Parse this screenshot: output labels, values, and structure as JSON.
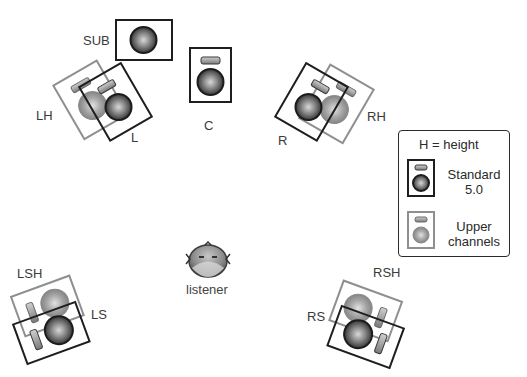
{
  "figure": {
    "type": "speaker-layout-diagram",
    "colors": {
      "standard_border": "#1e1e1e",
      "upper_border": "#8f8f8f",
      "woofer_dark": "#3a3a3a",
      "woofer_light": "#9a9a9a",
      "background": "#ffffff"
    }
  },
  "speakers": {
    "sub": {
      "label": "SUB",
      "group": "standard"
    },
    "l": {
      "label": "L",
      "group": "standard"
    },
    "lh": {
      "label": "LH",
      "group": "upper"
    },
    "c": {
      "label": "C",
      "group": "standard"
    },
    "r": {
      "label": "R",
      "group": "standard"
    },
    "rh": {
      "label": "RH",
      "group": "upper"
    },
    "ls": {
      "label": "LS",
      "group": "standard"
    },
    "lsh": {
      "label": "LSH",
      "group": "upper"
    },
    "rs": {
      "label": "RS",
      "group": "standard"
    },
    "rsh": {
      "label": "RSH",
      "group": "upper"
    }
  },
  "listener": {
    "label": "listener"
  },
  "legend": {
    "title": "H = height",
    "items": [
      {
        "label_line1": "Standard",
        "label_line2": "5.0",
        "icon": "standard-speaker-icon"
      },
      {
        "label_line1": "Upper",
        "label_line2": "channels",
        "icon": "upper-speaker-icon"
      }
    ]
  }
}
